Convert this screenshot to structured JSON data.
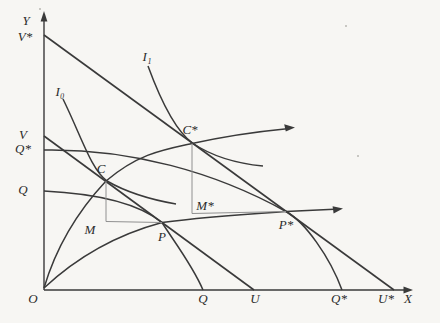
{
  "figure": {
    "type": "economics-trade-growth-diagram",
    "colors": {
      "background": "#f7f6f3",
      "line": "#3a3a3a",
      "light_line": "#909090",
      "text": "#2b2b2b"
    },
    "labels": {
      "y_axis": "Y",
      "x_axis": "X",
      "origin": "O",
      "v_star": "V*",
      "v": "V",
      "q_star_y": "Q*",
      "q_y": "Q",
      "q_x": "Q",
      "u": "U",
      "q_star_x": "Q*",
      "u_star": "U*",
      "i0": "I₀",
      "i1": "I₁",
      "c": "C",
      "c_star": "C*",
      "p": "P",
      "p_star": "P*",
      "m": "M",
      "m_star": "M*"
    }
  }
}
